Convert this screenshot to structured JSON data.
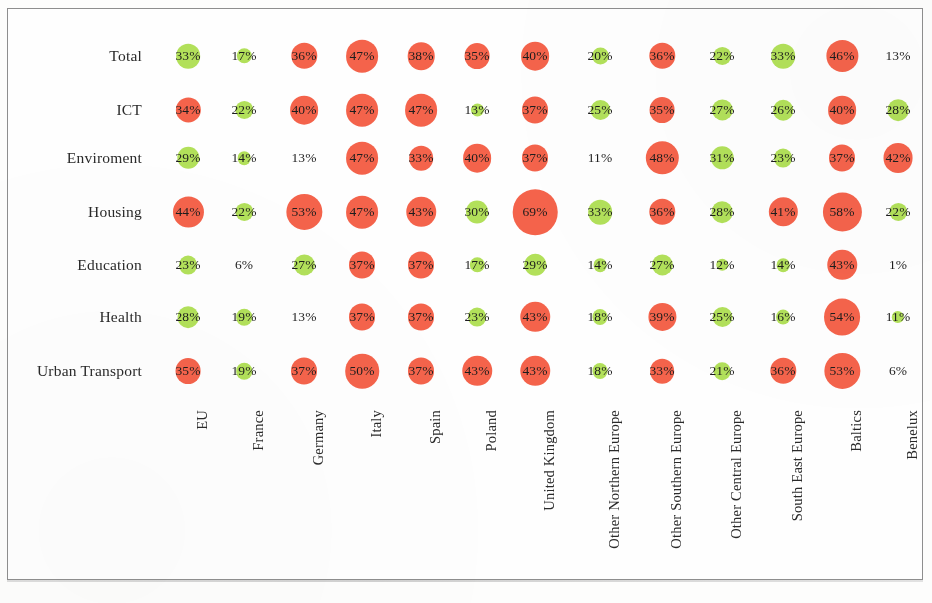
{
  "figure": {
    "kind": "bubble-matrix",
    "row_header_label": "",
    "frame_border_color": "#8e8e8e",
    "background_color": "#fefefe"
  },
  "colors": {
    "high": "#f4634b",
    "low": "#b2e05a",
    "text": "#1d1d1d",
    "label": "#2a2a2a"
  },
  "chart_data": {
    "type": "heatmap",
    "title": "",
    "subtitle": "",
    "xlabel": "",
    "ylabel": "",
    "legend": [],
    "categories": [
      "EU",
      "France",
      "Germany",
      "Italy",
      "Spain",
      "Poland",
      "United Kingdom",
      "Other Northern Europe",
      "Other Southern Europe",
      "Other Central Europe",
      "South East Europe",
      "Baltics",
      "Benelux"
    ],
    "rows": [
      "Total",
      "ICT",
      "Enviroment",
      "Housing",
      "Education",
      "Health",
      "Urban Transport"
    ],
    "series": [
      {
        "name": "Total",
        "values": [
          33,
          17,
          36,
          47,
          38,
          35,
          40,
          20,
          36,
          22,
          33,
          46,
          13
        ]
      },
      {
        "name": "ICT",
        "values": [
          34,
          22,
          40,
          47,
          47,
          13,
          37,
          25,
          35,
          27,
          26,
          40,
          28
        ]
      },
      {
        "name": "Enviroment",
        "values": [
          29,
          14,
          13,
          47,
          33,
          40,
          37,
          11,
          48,
          31,
          23,
          37,
          42
        ]
      },
      {
        "name": "Housing",
        "values": [
          44,
          22,
          53,
          47,
          43,
          30,
          69,
          33,
          36,
          28,
          41,
          58,
          22
        ]
      },
      {
        "name": "Education",
        "values": [
          23,
          6,
          27,
          37,
          37,
          17,
          29,
          14,
          27,
          12,
          14,
          43,
          1
        ]
      },
      {
        "name": "Health",
        "values": [
          28,
          19,
          13,
          37,
          37,
          23,
          43,
          18,
          39,
          25,
          16,
          54,
          11
        ]
      },
      {
        "name": "Urban Transport",
        "values": [
          35,
          19,
          37,
          50,
          37,
          43,
          43,
          18,
          33,
          21,
          36,
          53,
          6
        ]
      }
    ],
    "labels": [
      [
        "33%",
        "17%",
        "36%",
        "47%",
        "38%",
        "35%",
        "40%",
        "20%",
        "36%",
        "22%",
        "33%",
        "46%",
        "13%"
      ],
      [
        "34%",
        "22%",
        "40%",
        "47%",
        "47%",
        "13%",
        "37%",
        "25%",
        "35%",
        "27%",
        "26%",
        "40%",
        "28%"
      ],
      [
        "29%",
        "14%",
        "13%",
        "47%",
        "33%",
        "40%",
        "37%",
        "11%",
        "48%",
        "31%",
        "23%",
        "37%",
        "42%"
      ],
      [
        "44%",
        "22%",
        "53%",
        "47%",
        "43%",
        "30%",
        "69%",
        "33%",
        "36%",
        "28%",
        "41%",
        "58%",
        "22%"
      ],
      [
        "23%",
        "6%",
        "27%",
        "37%",
        "37%",
        "17%",
        "29%",
        "14%",
        "27%",
        "12%",
        "14%",
        "43%",
        "1%"
      ],
      [
        "28%",
        "19%",
        "13%",
        "37%",
        "37%",
        "23%",
        "43%",
        "18%",
        "39%",
        "25%",
        "16%",
        "54%",
        "11%"
      ],
      [
        "35%",
        "19%",
        "37%",
        "50%",
        "37%",
        "43%",
        "43%",
        "18%",
        "33%",
        "21%",
        "36%",
        "53%",
        "6%"
      ]
    ],
    "bubble_colors": [
      [
        "low",
        "low",
        "high",
        "high",
        "high",
        "high",
        "high",
        "low",
        "high",
        "low",
        "low",
        "high",
        "none"
      ],
      [
        "high",
        "low",
        "high",
        "high",
        "high",
        "low",
        "high",
        "low",
        "high",
        "low",
        "low",
        "high",
        "low"
      ],
      [
        "low",
        "low",
        "none",
        "high",
        "high",
        "high",
        "high",
        "none",
        "high",
        "low",
        "low",
        "high",
        "high"
      ],
      [
        "high",
        "low",
        "high",
        "high",
        "high",
        "low",
        "high",
        "low",
        "high",
        "low",
        "high",
        "high",
        "low"
      ],
      [
        "low",
        "none",
        "low",
        "high",
        "high",
        "low",
        "low",
        "low",
        "low",
        "low",
        "low",
        "high",
        "none"
      ],
      [
        "low",
        "low",
        "none",
        "high",
        "high",
        "low",
        "high",
        "low",
        "high",
        "low",
        "low",
        "high",
        "low"
      ],
      [
        "high",
        "low",
        "high",
        "high",
        "high",
        "high",
        "high",
        "low",
        "high",
        "low",
        "high",
        "high",
        "none"
      ]
    ]
  }
}
